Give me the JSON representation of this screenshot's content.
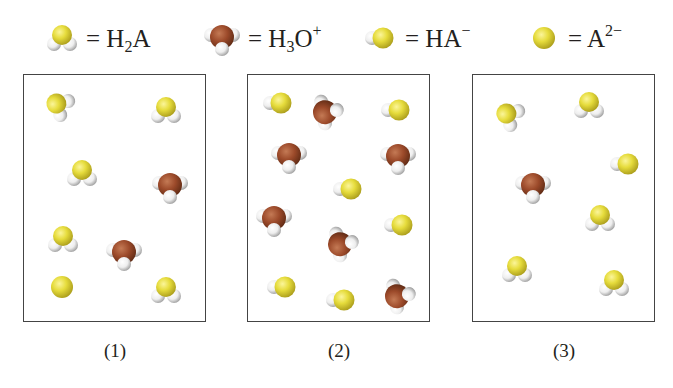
{
  "legend": {
    "items": [
      {
        "species": "H2A",
        "label_main": "= H",
        "label_sub": "2",
        "label_rest": "A",
        "label_sup": "",
        "icon": "h2a-molecule-icon"
      },
      {
        "species": "H3O+",
        "label_main": "= H",
        "label_sub": "3",
        "label_rest": "O",
        "label_sup": "+",
        "icon": "hydronium-molecule-icon"
      },
      {
        "species": "HA-",
        "label_main": "= HA",
        "label_sub": "",
        "label_rest": "",
        "label_sup": "−",
        "icon": "ha-anion-molecule-icon"
      },
      {
        "species": "A2-",
        "label_main": "= A",
        "label_sub": "",
        "label_rest": "",
        "label_sup": "2−",
        "icon": "a2-anion-molecule-icon"
      }
    ]
  },
  "colors": {
    "sulfur_yellow": "#e6dc3c",
    "oxygen_brown": "#9c4a2a",
    "hydrogen_white": "#f2f2f2",
    "box_border": "#444444"
  },
  "panels": [
    {
      "label": "(1)",
      "molecules": [
        {
          "type": "H2A",
          "x": 35,
          "y": 30,
          "rot": -60
        },
        {
          "type": "H2A",
          "x": 142,
          "y": 35,
          "rot": 0
        },
        {
          "type": "H2A",
          "x": 58,
          "y": 98,
          "rot": 0
        },
        {
          "type": "H3O+",
          "x": 146,
          "y": 111,
          "rot": 0
        },
        {
          "type": "H2A",
          "x": 39,
          "y": 164,
          "rot": 0
        },
        {
          "type": "H3O+",
          "x": 100,
          "y": 178,
          "rot": 0
        },
        {
          "type": "A2-",
          "x": 38,
          "y": 212,
          "rot": 0
        },
        {
          "type": "H2A",
          "x": 142,
          "y": 215,
          "rot": 0
        }
      ]
    },
    {
      "label": "(2)",
      "molecules": [
        {
          "type": "HA-",
          "x": 31,
          "y": 28,
          "rot": 0
        },
        {
          "type": "H3O+",
          "x": 78,
          "y": 37,
          "rot": -100
        },
        {
          "type": "HA-",
          "x": 149,
          "y": 35,
          "rot": 0
        },
        {
          "type": "H3O+",
          "x": 41,
          "y": 81,
          "rot": 0
        },
        {
          "type": "H3O+",
          "x": 150,
          "y": 82,
          "rot": 0
        },
        {
          "type": "HA-",
          "x": 101,
          "y": 114,
          "rot": 0
        },
        {
          "type": "H3O+",
          "x": 26,
          "y": 144,
          "rot": 0
        },
        {
          "type": "HA-",
          "x": 152,
          "y": 150,
          "rot": 0
        },
        {
          "type": "H3O+",
          "x": 93,
          "y": 169,
          "rot": -100
        },
        {
          "type": "HA-",
          "x": 35,
          "y": 212,
          "rot": 0
        },
        {
          "type": "HA-",
          "x": 94,
          "y": 225,
          "rot": 0
        },
        {
          "type": "H3O+",
          "x": 150,
          "y": 221,
          "rot": -100
        }
      ]
    },
    {
      "label": "(3)",
      "molecules": [
        {
          "type": "H2A",
          "x": 36,
          "y": 40,
          "rot": -60
        },
        {
          "type": "H2A",
          "x": 116,
          "y": 30,
          "rot": 0
        },
        {
          "type": "HA-",
          "x": 153,
          "y": 89,
          "rot": 0
        },
        {
          "type": "H3O+",
          "x": 60,
          "y": 111,
          "rot": 0
        },
        {
          "type": "H2A",
          "x": 127,
          "y": 143,
          "rot": 0
        },
        {
          "type": "H2A",
          "x": 44,
          "y": 194,
          "rot": 0
        },
        {
          "type": "H2A",
          "x": 141,
          "y": 208,
          "rot": 0
        }
      ]
    }
  ]
}
